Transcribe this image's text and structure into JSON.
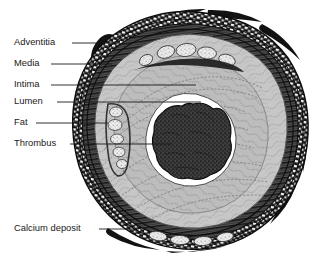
{
  "figure": {
    "background_color": "#ffffff",
    "width": 329,
    "height": 261
  },
  "labels": [
    {
      "id": "adventitia",
      "text": "Adventitia",
      "text_x": 14,
      "text_y": 43,
      "leader_x1": 72,
      "leader_x2": 118,
      "leader_y": 43,
      "target": "outer-connective-tissue-layer"
    },
    {
      "id": "media",
      "text": "Media",
      "text_x": 14,
      "text_y": 64,
      "leader_x1": 51,
      "leader_x2": 112,
      "leader_y": 64,
      "target": "smooth-muscle-layer"
    },
    {
      "id": "intima",
      "text": "Intima",
      "text_x": 14,
      "text_y": 85,
      "leader_x1": 51,
      "leader_x2": 196,
      "leader_y": 85,
      "target": "inner-fibrous-layer"
    },
    {
      "id": "lumen",
      "text": "Lumen",
      "text_x": 14,
      "text_y": 102,
      "leader_x1": 57,
      "leader_x2": 201,
      "leader_y": 102,
      "target": "blood-channel"
    },
    {
      "id": "fat",
      "text": "Fat",
      "text_x": 14,
      "text_y": 123,
      "leader_x1": 36,
      "leader_x2": 108,
      "leader_y": 123,
      "target": "lipid-deposits"
    },
    {
      "id": "thrombus",
      "text": "Thrombus",
      "text_x": 14,
      "text_y": 144,
      "leader_x1": 70,
      "leader_x2": 172,
      "leader_y": 144,
      "target": "blood-clot"
    },
    {
      "id": "calcium-deposit",
      "text": "Calcium deposit",
      "text_x": 14,
      "text_y": 229,
      "leader_x1": 99,
      "leader_x2": 139,
      "leader_y": 229,
      "target": "calcified-plaque"
    }
  ],
  "structures": {
    "adventitia": {
      "name": "Adventitia",
      "color": "#1c1c1c",
      "description": "Dark outer connective tissue layer with coarse block hatching and loose fibrous wisps"
    },
    "media": {
      "name": "Media",
      "color": "#4a4a4a",
      "description": "Striated smooth-muscle layer of concentric dark bands"
    },
    "intima": {
      "name": "Intima",
      "color": "#c9c9c9",
      "description": "Thickened fibrous inner layer with wavy lamellar stipple texture"
    },
    "lumen": {
      "name": "Lumen",
      "color": "#ffffff",
      "description": "Narrowed white blood channel at centre"
    },
    "fat": {
      "name": "Fat",
      "color": "#e8e8e8",
      "description": "Chain of pale lipid nodules within the plaque on the left wall"
    },
    "thrombus": {
      "name": "Thrombus",
      "color": "#3a3a3a",
      "description": "Dark lobulated stippled clot occupying the lumen"
    },
    "calcium_deposit": {
      "name": "Calcium deposit",
      "color": "#efefef",
      "description": "Bright mineralised nodules along the superior and inferior plaque"
    }
  }
}
